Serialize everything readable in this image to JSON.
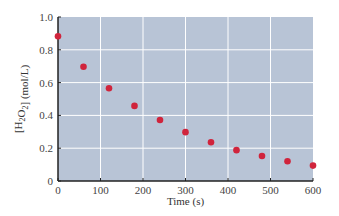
{
  "chart_data": {
    "type": "scatter",
    "title": "",
    "xlabel": "Time (s)",
    "ylabel": "[H2O2] (mol/L)",
    "xlim": [
      0,
      600
    ],
    "ylim": [
      0,
      1.0
    ],
    "x_ticks": [
      0,
      100,
      200,
      300,
      400,
      500,
      600
    ],
    "y_ticks": [
      0,
      0.2,
      0.4,
      0.6,
      0.8,
      1.0
    ],
    "y_tick_labels": [
      "0",
      "0.2",
      "0.4",
      "0.6",
      "0.8",
      "1.0"
    ],
    "grid": true,
    "legend": null,
    "series": [
      {
        "name": "[H2O2]",
        "x": [
          0,
          60,
          120,
          180,
          240,
          300,
          360,
          420,
          480,
          540,
          600
        ],
        "values": [
          0.882,
          0.697,
          0.566,
          0.458,
          0.372,
          0.298,
          0.236,
          0.188,
          0.152,
          0.12,
          0.094
        ]
      }
    ],
    "colors": {
      "background": "#b8c4d6",
      "grid": "#ffffff",
      "points": "#d0243c",
      "axis": "#222222"
    }
  }
}
